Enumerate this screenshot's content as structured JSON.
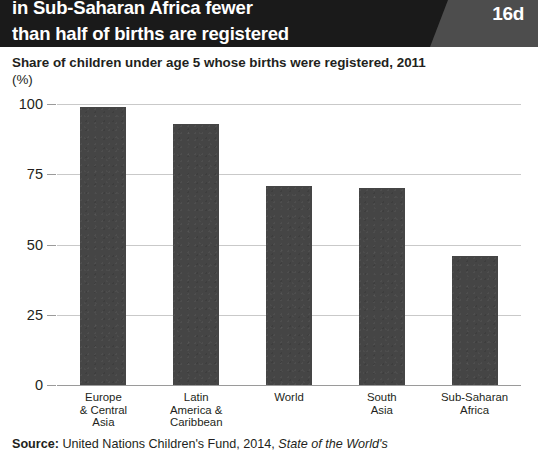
{
  "header": {
    "line1": "in Sub-Saharan Africa fewer",
    "line2": "than half of births are registered",
    "badge": "16d",
    "background_color": "#1a1a1a",
    "badge_panel_color": "#4d4d4d",
    "text_color": "#ffffff"
  },
  "subtitle": {
    "text": "Share of children under age 5 whose births were registered, 2011",
    "unit": "(%)"
  },
  "source": {
    "label": "Source:",
    "text": " United Nations Children's Fund, 2014, ",
    "italic": "State of the World's"
  },
  "chart_data": {
    "type": "bar",
    "title": "Share of children under age 5 whose births were registered, 2011",
    "xlabel": "",
    "ylabel": "(%)",
    "ylim": [
      0,
      100
    ],
    "yticks": [
      0,
      25,
      50,
      75,
      100
    ],
    "grid": true,
    "legend": "none",
    "bar_color": "#454545",
    "categories": [
      "Europe & Central Asia",
      "Latin America & Caribbean",
      "World",
      "South Asia",
      "Sub-Saharan Africa"
    ],
    "category_lines": [
      [
        "Europe",
        "& Central",
        "Asia"
      ],
      [
        "Latin",
        "America &",
        "Caribbean"
      ],
      [
        "World"
      ],
      [
        "South",
        "Asia"
      ],
      [
        "Sub-Saharan",
        "Africa"
      ]
    ],
    "values": [
      99,
      93,
      71,
      70,
      46
    ]
  }
}
